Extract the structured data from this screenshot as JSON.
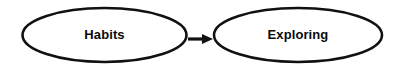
{
  "diagram": {
    "background_color": "#ffffff",
    "stroke_color": "#111111",
    "text_color": "#0a0a0a",
    "nodes": [
      {
        "id": "habits",
        "label": "Habits",
        "shape": "ellipse",
        "cx": 104.5,
        "cy": 35,
        "rx": 82,
        "ry": 27,
        "stroke_width": 2.6
      },
      {
        "id": "exploring",
        "label": "Exploring",
        "shape": "ellipse",
        "cx": 298,
        "cy": 35,
        "rx": 84,
        "ry": 27,
        "stroke_width": 2.6
      }
    ],
    "edges": [
      {
        "id": "habits-to-exploring",
        "from": "habits",
        "to": "exploring",
        "label": "",
        "marker": "solid-triangle-arrowhead",
        "direction": "right",
        "x1": 188,
        "x2": 206,
        "y": 39,
        "stroke_width": 3,
        "head_tip_x": 213,
        "head_back_x": 203,
        "head_half_height": 5
      }
    ]
  }
}
